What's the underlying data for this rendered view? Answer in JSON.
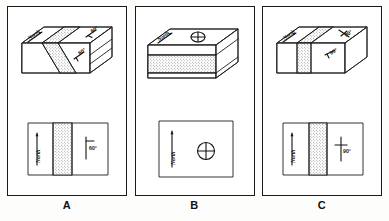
{
  "figure": {
    "kind": "geology-block-and-map-diagrams",
    "background_color": "#fdfdfc",
    "line_color": "#1d1d1d",
    "stipple_color": "#3a3a3a"
  },
  "panels": [
    {
      "id": "A",
      "letter": "A",
      "block": {
        "type": "block-diagram",
        "bed_attitude": "inclined",
        "north_label": "North",
        "dip_labels": [
          "60°",
          "60°"
        ],
        "stipple_band": true
      },
      "map": {
        "type": "map-view",
        "north_label": "North",
        "symbol": "strike-and-dip",
        "dip_label": "60°",
        "stipple_band": true
      }
    },
    {
      "id": "B",
      "letter": "B",
      "block": {
        "type": "block-diagram",
        "bed_attitude": "horizontal",
        "north_label": "North",
        "dip_labels": [],
        "symbol": "horizontal-bed-circle-cross",
        "stipple_band": true
      },
      "map": {
        "type": "map-view",
        "north_label": "North",
        "symbol": "horizontal-bed-circle-cross",
        "dip_label": "",
        "stipple_band": false
      }
    },
    {
      "id": "C",
      "letter": "C",
      "block": {
        "type": "block-diagram",
        "bed_attitude": "vertical",
        "north_label": "North",
        "dip_labels": [
          "90°",
          "90°"
        ],
        "stipple_band": true
      },
      "map": {
        "type": "map-view",
        "north_label": "North",
        "symbol": "vertical-bed-cross",
        "dip_label": "90°",
        "stipple_band": true
      }
    }
  ]
}
